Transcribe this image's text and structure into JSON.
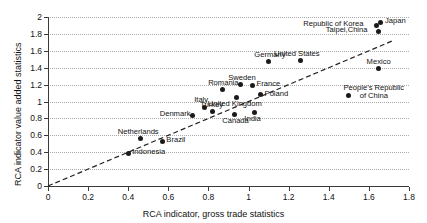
{
  "chart_data": {
    "type": "scatter",
    "title": "",
    "xlabel": "RCA indicator, gross trade statistics",
    "ylabel": "RCA indicator value added statistics",
    "xlim": [
      0,
      1.8
    ],
    "ylim": [
      0,
      2
    ],
    "xticks": [
      "0",
      "0.2",
      "0.4",
      "0.6",
      "0.8",
      "1",
      "1.2",
      "1.4",
      "1.6",
      "1.8"
    ],
    "xtick_values": [
      0,
      0.2,
      0.4,
      0.6,
      0.8,
      1.0,
      1.2,
      1.4,
      1.6,
      1.8
    ],
    "yticks": [
      "0",
      "0.2",
      "0.4",
      "0.6",
      "0.8",
      "1",
      "1.2",
      "1.4",
      "1.6",
      "1.8",
      "2"
    ],
    "ytick_values": [
      0,
      0.2,
      0.4,
      0.6,
      0.8,
      1.0,
      1.2,
      1.4,
      1.6,
      1.8,
      2.0
    ],
    "grid": true,
    "grid_style": "dotted-horizontal",
    "legend": "none",
    "marker_color": "#1a1a1a",
    "reference_line": {
      "style": "dashed",
      "label": "45-degree identity line",
      "from": [
        0,
        0
      ],
      "to": [
        1.72,
        1.72
      ]
    },
    "points": [
      {
        "name": "Japan",
        "x": 1.66,
        "y": 1.94,
        "label_pos": "right"
      },
      {
        "name": "Republic of Korea",
        "x": 1.64,
        "y": 1.9,
        "label_pos": "left"
      },
      {
        "name": "Taipei,China",
        "x": 1.65,
        "y": 1.83,
        "label_pos": "left"
      },
      {
        "name": "United States",
        "x": 1.26,
        "y": 1.48,
        "label_pos": "above"
      },
      {
        "name": "Germany",
        "x": 1.1,
        "y": 1.47,
        "label_pos": "above"
      },
      {
        "name": "Mexico",
        "x": 1.65,
        "y": 1.39,
        "label_pos": "above"
      },
      {
        "name": "Sweden",
        "x": 0.96,
        "y": 1.2,
        "label_pos": "above"
      },
      {
        "name": "France",
        "x": 1.02,
        "y": 1.19,
        "label_pos": "right"
      },
      {
        "name": "Romania",
        "x": 0.87,
        "y": 1.14,
        "label_pos": "above"
      },
      {
        "name": "Poland",
        "x": 1.06,
        "y": 1.08,
        "label_pos": "right"
      },
      {
        "name": "People's Republic of China",
        "x": 1.5,
        "y": 1.07,
        "label_pos": "above"
      },
      {
        "name": "United Kingdom",
        "x": 0.94,
        "y": 1.05,
        "label_pos": "below"
      },
      {
        "name": "Italy",
        "x": 0.78,
        "y": 0.93,
        "label_pos": "above"
      },
      {
        "name": "Turkey",
        "x": 0.82,
        "y": 0.88,
        "label_pos": "above"
      },
      {
        "name": "India",
        "x": 1.03,
        "y": 0.87,
        "label_pos": "below"
      },
      {
        "name": "Canada",
        "x": 0.93,
        "y": 0.85,
        "label_pos": "below"
      },
      {
        "name": "Denmark",
        "x": 0.72,
        "y": 0.84,
        "label_pos": "left"
      },
      {
        "name": "Netherlands",
        "x": 0.46,
        "y": 0.56,
        "label_pos": "above"
      },
      {
        "name": "Brazil",
        "x": 0.57,
        "y": 0.53,
        "label_pos": "right"
      },
      {
        "name": "Indonesia",
        "x": 0.4,
        "y": 0.39,
        "label_pos": "right"
      }
    ]
  }
}
